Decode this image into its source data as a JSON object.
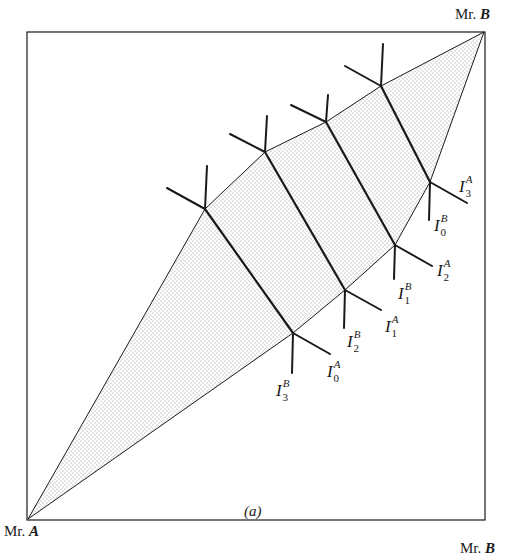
{
  "figure": {
    "caption": "(a)",
    "corner_labels": {
      "origin_a_prefix": "Mr.",
      "origin_a_name": "A",
      "origin_b_prefix": "Mr.",
      "origin_b_name": "B",
      "bottom_cut_prefix": "Mr.",
      "bottom_cut_name": "B"
    },
    "indifference_labels": [
      {
        "id": "I3A",
        "base": "I",
        "sub": "3",
        "sup": "A"
      },
      {
        "id": "I0B",
        "base": "I",
        "sub": "0",
        "sup": "B"
      },
      {
        "id": "I2A",
        "base": "I",
        "sub": "2",
        "sup": "A"
      },
      {
        "id": "I1B",
        "base": "I",
        "sub": "1",
        "sup": "B"
      },
      {
        "id": "I1A",
        "base": "I",
        "sub": "1",
        "sup": "A"
      },
      {
        "id": "I2B",
        "base": "I",
        "sub": "2",
        "sup": "B"
      },
      {
        "id": "I0A",
        "base": "I",
        "sub": "0",
        "sup": "A"
      },
      {
        "id": "I3B",
        "base": "I",
        "sub": "3",
        "sup": "B"
      }
    ],
    "colors": {
      "line": "#1a1a1a",
      "stipple": "#8a8a8a",
      "background": "#ffffff"
    }
  }
}
